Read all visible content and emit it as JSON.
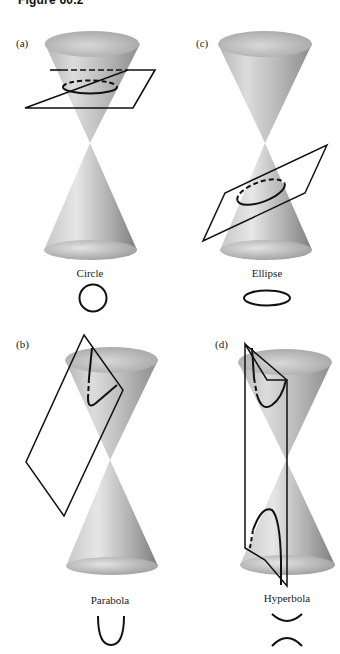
{
  "figure": {
    "title": "Figure 60.2"
  },
  "panels": [
    {
      "id": "a",
      "label": "(a)",
      "name": "Circle",
      "description": "Horizontal plane cuts upper nappe perpendicular to axis"
    },
    {
      "id": "c",
      "label": "(c)",
      "name": "Ellipse",
      "description": "Tilted plane cuts lower nappe obliquely"
    },
    {
      "id": "b",
      "label": "(b)",
      "name": "Parabola",
      "description": "Plane parallel to cone generator cuts upper nappe"
    },
    {
      "id": "d",
      "label": "(d)",
      "name": "Hyperbola",
      "description": "Vertical plane cuts both nappes"
    }
  ],
  "colors": {
    "cone_light": "#e8e8e8",
    "cone_dark": "#8a8a8a",
    "line": "#111111",
    "background": "#ffffff"
  }
}
